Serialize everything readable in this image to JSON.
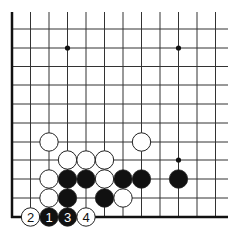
{
  "diagram": {
    "type": "go-board-fragment",
    "colors": {
      "line": "#333333",
      "edge": "#111111",
      "black_stone": "#111111",
      "white_stone": "#ffffff",
      "stone_outline": "#222222",
      "star_point": "#111111"
    },
    "grid": {
      "columns_x": [
        12,
        30.5,
        49,
        67.5,
        86,
        104.5,
        123,
        141.5,
        160,
        178.5,
        197,
        215.5
      ],
      "rows_y": [
        29,
        48,
        66.5,
        85,
        104,
        123,
        142,
        160,
        179,
        198,
        217
      ],
      "top_y": 12,
      "right_x": 228,
      "left_edge": true,
      "bottom_edge": true,
      "stone_radius": 9.2
    },
    "star_points": [
      {
        "col": 3,
        "row": 1
      },
      {
        "col": 9,
        "row": 1
      },
      {
        "col": 9,
        "row": 7
      }
    ],
    "stones": [
      {
        "color": "white",
        "col": 2,
        "row": 6
      },
      {
        "color": "white",
        "col": 7,
        "row": 6
      },
      {
        "color": "white",
        "col": 3,
        "row": 7
      },
      {
        "color": "white",
        "col": 4,
        "row": 7
      },
      {
        "color": "white",
        "col": 5,
        "row": 7
      },
      {
        "color": "white",
        "col": 2,
        "row": 8
      },
      {
        "color": "black",
        "col": 3,
        "row": 8
      },
      {
        "color": "black",
        "col": 4,
        "row": 8
      },
      {
        "color": "white",
        "col": 5,
        "row": 8
      },
      {
        "color": "black",
        "col": 6,
        "row": 8
      },
      {
        "color": "black",
        "col": 7,
        "row": 8
      },
      {
        "color": "black",
        "col": 9,
        "row": 8
      },
      {
        "color": "white",
        "col": 2,
        "row": 9
      },
      {
        "color": "black",
        "col": 3,
        "row": 9
      },
      {
        "color": "black",
        "col": 5,
        "row": 9
      },
      {
        "color": "white",
        "col": 6,
        "row": 9
      }
    ],
    "numbered_stones": [
      {
        "color": "white",
        "col": 1,
        "row": 10,
        "label": "2"
      },
      {
        "color": "black",
        "col": 2,
        "row": 10,
        "label": "1"
      },
      {
        "color": "black",
        "col": 3,
        "row": 10,
        "label": "3"
      },
      {
        "color": "white",
        "col": 4,
        "row": 10,
        "label": "4"
      }
    ]
  }
}
